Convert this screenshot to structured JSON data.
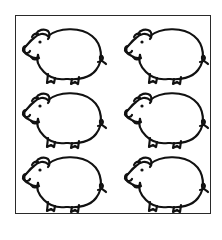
{
  "image": {
    "description": "Line drawing of six cartoon pigs arranged in a 2-column by 3-row grid inside a rectangular border",
    "layout": {
      "columns": 2,
      "rows": 3
    },
    "stroke_color": "#111111",
    "background": "#ffffff",
    "border_color": "#2a2a2a",
    "pigs": [
      {
        "row": 1,
        "col": 1,
        "facing": "left"
      },
      {
        "row": 1,
        "col": 2,
        "facing": "left"
      },
      {
        "row": 2,
        "col": 1,
        "facing": "left"
      },
      {
        "row": 2,
        "col": 2,
        "facing": "left"
      },
      {
        "row": 3,
        "col": 1,
        "facing": "left"
      },
      {
        "row": 3,
        "col": 2,
        "facing": "left"
      }
    ]
  }
}
